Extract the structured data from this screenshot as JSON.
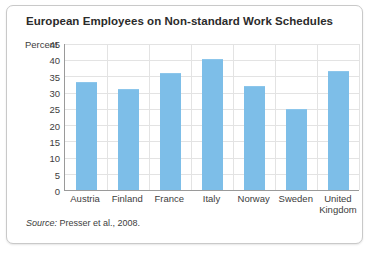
{
  "figure": {
    "title": "European Employees on Non-standard Work Schedules",
    "source_label": "Source:",
    "source_text": " Presser et al., 2008."
  },
  "chart_data": {
    "type": "bar",
    "title": "European Employees on Non-standard Work Schedules",
    "xlabel": "",
    "ylabel": "Percent",
    "ylim": [
      0,
      45
    ],
    "yticks": [
      0,
      5,
      10,
      15,
      20,
      25,
      30,
      35,
      40,
      45
    ],
    "ytick_labels": [
      "0",
      "5",
      "10",
      "15",
      "20",
      "25",
      "30",
      "35",
      "40",
      "45"
    ],
    "grid": true,
    "legend": false,
    "bar_color": "#7dbee8",
    "categories": [
      "Austria",
      "Finland",
      "France",
      "Italy",
      "Norway",
      "Sweden",
      "United Kingdom"
    ],
    "category_lines": [
      [
        "Austria"
      ],
      [
        "Finland"
      ],
      [
        "France"
      ],
      [
        "Italy"
      ],
      [
        "Norway"
      ],
      [
        "Sweden"
      ],
      [
        "United",
        "Kingdom"
      ]
    ],
    "values": [
      33.0,
      30.7,
      35.8,
      40.0,
      31.7,
      24.7,
      36.5
    ]
  }
}
